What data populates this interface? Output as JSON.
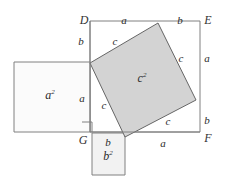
{
  "figure": {
    "type": "geometric-diagram",
    "canvas": {
      "width": 225,
      "height": 179,
      "background": "#ffffff"
    },
    "colors": {
      "stroke": "#808080",
      "stroke_dark": "#666666",
      "fill_c_square": "#d3d3d3",
      "fill_a_square": "#fbfbfb",
      "fill_b_square": "#f2f2f2",
      "fill_outer": "#ffffff",
      "label_color": "#2b2b2b"
    },
    "shapes": {
      "outer_square": {
        "name": "outer-square-DEFG",
        "points": "90,21 200,21 200,132 90,132",
        "fill": "#ffffff",
        "stroke": "#808080"
      },
      "c_square": {
        "name": "tilted-square-c2",
        "points": "90,63 158,23 196,100 125,137",
        "fill": "#d3d3d3",
        "stroke": "#666666"
      },
      "a_square": {
        "name": "square-a2",
        "points": "14,62 90,62 90,132 14,132",
        "fill": "#fbfbfb",
        "stroke": "#808080"
      },
      "b_square": {
        "name": "square-b2",
        "points": "92,133 125,133 125,175 92,175",
        "fill": "#f2f2f2",
        "stroke": "#808080"
      },
      "right_angle_marker": {
        "name": "right-angle-marker",
        "points": "82,122 92,122 92,132",
        "stroke": "#808080"
      }
    },
    "vertices": [
      {
        "id": "D",
        "label": "D",
        "x": 84,
        "y": 20
      },
      {
        "id": "E",
        "label": "E",
        "x": 208,
        "y": 20
      },
      {
        "id": "F",
        "label": "F",
        "x": 208,
        "y": 138
      },
      {
        "id": "G",
        "label": "G",
        "x": 83,
        "y": 140
      }
    ],
    "side_labels": [
      {
        "id": "top-a",
        "label": "a",
        "x": 124,
        "y": 20
      },
      {
        "id": "top-b",
        "label": "b",
        "x": 180,
        "y": 20
      },
      {
        "id": "left-upper-b",
        "label": "b",
        "x": 81,
        "y": 41
      },
      {
        "id": "left-lower-a",
        "label": "a",
        "x": 82,
        "y": 98
      },
      {
        "id": "right-upper-a",
        "label": "a",
        "x": 207,
        "y": 58
      },
      {
        "id": "right-lower-b",
        "label": "b",
        "x": 207,
        "y": 120
      },
      {
        "id": "bottom-b",
        "label": "b",
        "x": 108,
        "y": 142
      },
      {
        "id": "bottom-a",
        "label": "a",
        "x": 163,
        "y": 143
      },
      {
        "id": "chord-c-top",
        "label": "c",
        "x": 115,
        "y": 41
      },
      {
        "id": "chord-c-right",
        "label": "c",
        "x": 181,
        "y": 58
      },
      {
        "id": "chord-c-left",
        "label": "c",
        "x": 104,
        "y": 105
      },
      {
        "id": "chord-c-bottom",
        "label": "c",
        "x": 168,
        "y": 121
      }
    ],
    "area_labels": [
      {
        "id": "area-a2",
        "base": "a",
        "exp": "2",
        "x": 50,
        "y": 95
      },
      {
        "id": "area-b2",
        "base": "b",
        "exp": "2",
        "x": 108,
        "y": 156
      },
      {
        "id": "area-c2",
        "base": "c",
        "exp": "2",
        "x": 142,
        "y": 78
      }
    ]
  }
}
